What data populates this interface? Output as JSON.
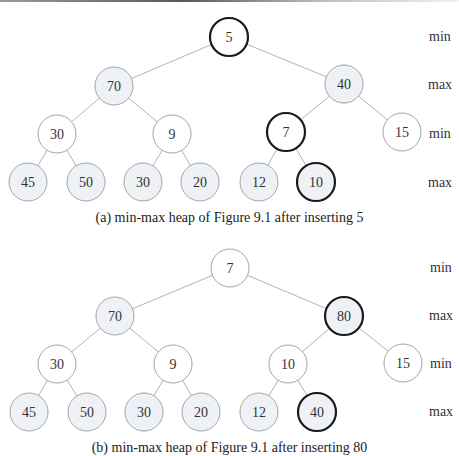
{
  "figures": [
    {
      "id": "a",
      "caption": "(a) min-max heap of Figure 9.1 after inserting 5",
      "level_labels": [
        "min",
        "max",
        "min",
        "max"
      ],
      "nodes": [
        {
          "value": "5",
          "level": "min",
          "highlight": true
        },
        {
          "value": "70",
          "level": "max",
          "highlight": false
        },
        {
          "value": "40",
          "level": "max",
          "highlight": false
        },
        {
          "value": "30",
          "level": "min",
          "highlight": false
        },
        {
          "value": "9",
          "level": "min",
          "highlight": false
        },
        {
          "value": "7",
          "level": "min",
          "highlight": true
        },
        {
          "value": "15",
          "level": "min",
          "highlight": false
        },
        {
          "value": "45",
          "level": "max",
          "highlight": false
        },
        {
          "value": "50",
          "level": "max",
          "highlight": false
        },
        {
          "value": "30",
          "level": "max",
          "highlight": false
        },
        {
          "value": "20",
          "level": "max",
          "highlight": false
        },
        {
          "value": "12",
          "level": "max",
          "highlight": false
        },
        {
          "value": "10",
          "level": "max",
          "highlight": true
        }
      ]
    },
    {
      "id": "b",
      "caption": "(b) min-max heap of Figure 9.1 after inserting 80",
      "level_labels": [
        "min",
        "max",
        "min",
        "max"
      ],
      "nodes": [
        {
          "value": "7",
          "level": "min",
          "highlight": false
        },
        {
          "value": "70",
          "level": "max",
          "highlight": false
        },
        {
          "value": "80",
          "level": "max",
          "highlight": true
        },
        {
          "value": "30",
          "level": "min",
          "highlight": false
        },
        {
          "value": "9",
          "level": "min",
          "highlight": false
        },
        {
          "value": "10",
          "level": "min",
          "highlight": false
        },
        {
          "value": "15",
          "level": "min",
          "highlight": false
        },
        {
          "value": "45",
          "level": "max",
          "highlight": false
        },
        {
          "value": "50",
          "level": "max",
          "highlight": false
        },
        {
          "value": "30",
          "level": "max",
          "highlight": false
        },
        {
          "value": "20",
          "level": "max",
          "highlight": false
        },
        {
          "value": "12",
          "level": "max",
          "highlight": false
        },
        {
          "value": "40",
          "level": "max",
          "highlight": true
        }
      ]
    }
  ],
  "colors": {
    "min_fill": "#ffffff",
    "max_fill": "#eef1f6",
    "node_stroke": "#9a9a9a",
    "highlight_stroke": "#1a1a1a",
    "edge": "#a9a9a9"
  }
}
